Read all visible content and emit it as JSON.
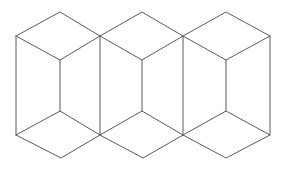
{
  "figure": {
    "background_color": "#ffffff",
    "stroke_color": "#5a5a5a",
    "stroke_width": 1,
    "canvas": {
      "width": 286,
      "height": 172
    },
    "cube_count": 3,
    "faces_per_cube": 3,
    "unit_spacing_x": 83,
    "geometry": {
      "cubes": [
        {
          "name": "cube-left",
          "left_vertex": [
            16,
            36
          ],
          "top_apex": [
            60,
            12
          ],
          "right_vertex": [
            100,
            36
          ],
          "center_top": [
            60,
            60
          ],
          "center_bottom": [
            60,
            111
          ],
          "left_bottom": [
            16,
            135
          ],
          "bottom_apex": [
            61,
            158
          ],
          "right_bottom": [
            100,
            135
          ]
        },
        {
          "name": "cube-middle",
          "left_vertex": [
            100,
            36
          ],
          "top_apex": [
            142,
            12
          ],
          "right_vertex": [
            183,
            36
          ],
          "center_top": [
            142,
            60
          ],
          "center_bottom": [
            142,
            111
          ],
          "left_bottom": [
            100,
            135
          ],
          "bottom_apex": [
            143,
            158
          ],
          "right_bottom": [
            183,
            135
          ]
        },
        {
          "name": "cube-right",
          "left_vertex": [
            183,
            36
          ],
          "top_apex": [
            226,
            12
          ],
          "right_vertex": [
            270,
            36
          ],
          "center_top": [
            226,
            60
          ],
          "center_bottom": [
            226,
            111
          ],
          "left_bottom": [
            183,
            135
          ],
          "bottom_apex": [
            226,
            158
          ],
          "right_bottom": [
            270,
            135
          ]
        }
      ]
    }
  }
}
